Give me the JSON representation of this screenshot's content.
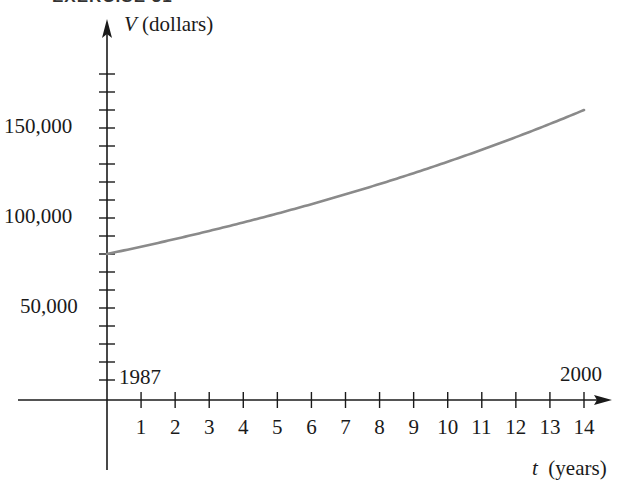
{
  "figure": {
    "clipped_heading": "EXERCISE 31"
  },
  "chart_data": {
    "type": "line",
    "title": "",
    "xlabel": "t (years)",
    "ylabel": "V (dollars)",
    "x_var": "t",
    "x_unit": "(years)",
    "y_var": "V",
    "y_unit": "(dollars)",
    "xlim": [
      0,
      14
    ],
    "ylim": [
      0,
      180000
    ],
    "x_ticks": [
      1,
      2,
      3,
      4,
      5,
      6,
      7,
      8,
      9,
      10,
      11,
      12,
      13,
      14
    ],
    "x_tick_labels": [
      "1",
      "2",
      "3",
      "4",
      "5",
      "6",
      "7",
      "8",
      "9",
      "10",
      "11",
      "12",
      "13",
      "14"
    ],
    "y_ticks": [
      10000,
      20000,
      30000,
      40000,
      50000,
      60000,
      70000,
      80000,
      90000,
      100000,
      110000,
      120000,
      130000,
      140000,
      150000,
      160000,
      170000,
      180000
    ],
    "y_tick_labels": {
      "50000": "50,000",
      "100000": "100,000",
      "150000": "150,000"
    },
    "annotations": [
      {
        "text": "1987",
        "at": "t=0"
      },
      {
        "text": "2000",
        "at": "t=14"
      }
    ],
    "grid": false,
    "series": [
      {
        "name": "V(t)",
        "x": [
          0,
          1,
          2,
          3,
          4,
          5,
          6,
          7,
          8,
          9,
          10,
          11,
          12,
          13,
          14
        ],
        "values": [
          80000,
          84000,
          88300,
          92800,
          97500,
          102400,
          107600,
          113100,
          118900,
          124900,
          131300,
          137900,
          144900,
          152300,
          160000
        ],
        "color": "#8a8a8a"
      }
    ]
  },
  "labels": {
    "y_var": "V",
    "y_unit": " (dollars)",
    "x_var": "t",
    "x_unit": "(years)",
    "y150": "150,000",
    "y100": "100,000",
    "y50": "50,000",
    "start_year": "1987",
    "end_year": "2000"
  }
}
